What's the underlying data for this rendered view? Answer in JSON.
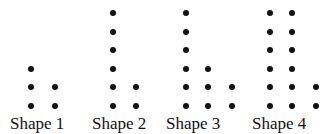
{
  "figure": {
    "dot_color": "#111111",
    "background": "#ffffff",
    "row_y": [
      13,
      32,
      50,
      69,
      87,
      106
    ],
    "shapes": [
      {
        "label": "Shape 1",
        "label_x": 10,
        "columns": [
          {
            "x": 31,
            "count": 3
          },
          {
            "x": 55,
            "count": 2
          }
        ]
      },
      {
        "label": "Shape 2",
        "label_x": 92,
        "columns": [
          {
            "x": 113,
            "count": 6
          },
          {
            "x": 136,
            "count": 2
          }
        ]
      },
      {
        "label": "Shape 3",
        "label_x": 166,
        "columns": [
          {
            "x": 186,
            "count": 6
          },
          {
            "x": 208,
            "count": 3
          },
          {
            "x": 232,
            "count": 2
          }
        ]
      },
      {
        "label": "Shape 4",
        "label_x": 252,
        "columns": [
          {
            "x": 270,
            "count": 6
          },
          {
            "x": 292,
            "count": 6
          },
          {
            "x": 316,
            "count": 2
          }
        ]
      }
    ]
  }
}
